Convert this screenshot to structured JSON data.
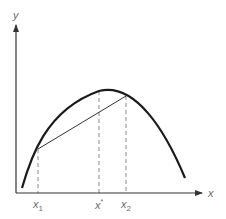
{
  "figure": {
    "axes": {
      "x_label": "x",
      "y_label": "y"
    },
    "ticks": [
      {
        "name": "x1",
        "base": "x",
        "subscript": "1",
        "superscript": ""
      },
      {
        "name": "x-star",
        "base": "x",
        "subscript": "",
        "superscript": "*"
      },
      {
        "name": "x2",
        "base": "x",
        "subscript": "2",
        "superscript": ""
      }
    ],
    "elements": {
      "curve": "concave curve",
      "chord": "secant line between points at x1 and x2",
      "guides": "dashed vertical lines at x1, x*, x2"
    },
    "colors": {
      "curve": "#1a1a1a",
      "axis": "#333333",
      "dashed": "#8a8a8a",
      "label": "#6b6b6b"
    }
  }
}
